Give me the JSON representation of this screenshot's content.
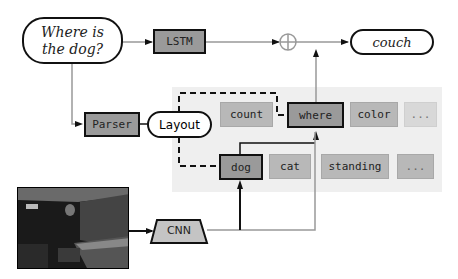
{
  "question": {
    "line1": "Where is",
    "line2": "the dog?"
  },
  "lstm": "LSTM",
  "answer": "couch",
  "parser": "Parser",
  "layout": "Layout",
  "cnn": "CNN",
  "modules_row1": [
    {
      "label": "count",
      "style": "mod"
    },
    {
      "label": "where",
      "style": "dark"
    },
    {
      "label": "color",
      "style": "mod"
    },
    {
      "label": "...",
      "style": "faint"
    }
  ],
  "modules_row2": [
    {
      "label": "dog",
      "style": "dark"
    },
    {
      "label": "cat",
      "style": "mod"
    },
    {
      "label": "standing",
      "style": "mod"
    },
    {
      "label": "...",
      "style": "mod"
    }
  ],
  "combine_symbol": "⊕",
  "image_alt": "dark room photo with couch"
}
